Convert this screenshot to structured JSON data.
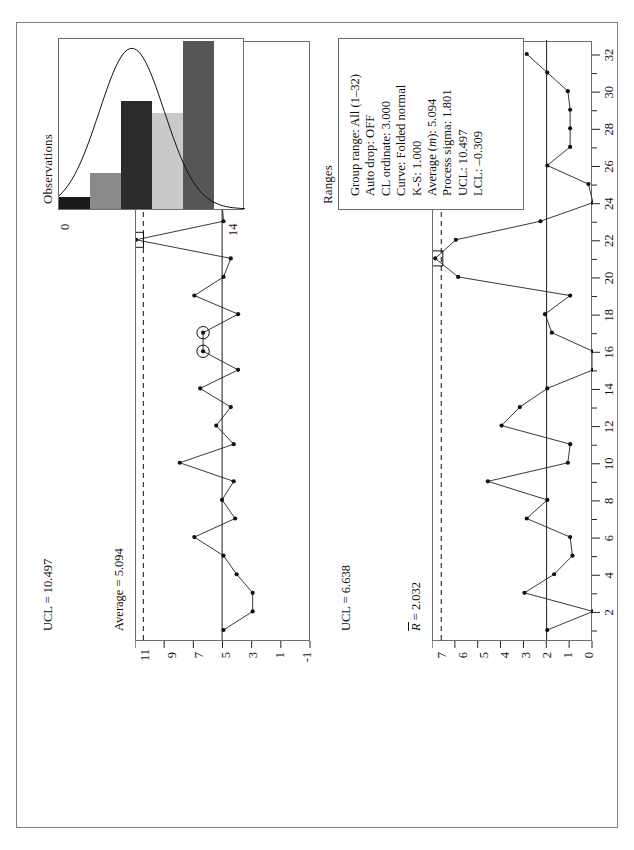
{
  "page": {
    "orientation": "landscape-rotated-90ccw",
    "border_color": "#808080"
  },
  "observations_panel": {
    "title": "Observations",
    "ucl_label": "UCL = 10.497",
    "center_label": "Average = 5.094",
    "y_ticks": [
      "11",
      "9",
      "7",
      "5",
      "3",
      "1",
      "-1"
    ]
  },
  "ranges_panel": {
    "title": "Ranges",
    "ucl_label": "UCL = 6.638",
    "center_label_prefix": "R",
    "center_label_suffix": " = 2.032",
    "lcl_label": "LCL = 0.000",
    "y_ticks": [
      "7",
      "6",
      "5",
      "4",
      "3",
      "2",
      "1",
      "0"
    ],
    "x_ticks": [
      "2",
      "4",
      "6",
      "8",
      "10",
      "12",
      "14",
      "16",
      "18",
      "20",
      "22",
      "24",
      "26",
      "28",
      "30",
      "32"
    ]
  },
  "stats": {
    "lines": [
      "Group range: All (1–32)",
      "Auto drop: OFF",
      "CL ordinate: 3.000",
      "Curve: Folded normal",
      "K-S: 1.000",
      "Process sigma: 1.801",
      "UCL: 10.497",
      "LCL: –0.309"
    ],
    "average_prefix": "Average (",
    "average_italic": "m",
    "average_suffix": "): 5.094"
  },
  "histogram": {
    "axis_min_label": "0",
    "axis_max_label": "14",
    "bin_counts": [
      1,
      3,
      9,
      8,
      14,
      0
    ],
    "bin_colors": [
      "#1a1a1a",
      "#8a8a8a",
      "#2b2b2b",
      "#c9c9c9",
      "#565656",
      "#ffffff"
    ],
    "max_count": 14,
    "curve_color": "#111111"
  },
  "chart_data": [
    {
      "type": "line",
      "title": "Observations",
      "xlabel": "",
      "ylabel": "Observations",
      "ylim": [
        -1,
        11
      ],
      "y_ticks": [
        11,
        9,
        7,
        5,
        3,
        1,
        -1
      ],
      "x": [
        1,
        2,
        3,
        4,
        5,
        6,
        7,
        8,
        9,
        10,
        11,
        12,
        13,
        14,
        15,
        16,
        17,
        18,
        19,
        20,
        21,
        22,
        23,
        24,
        25,
        26,
        27,
        28,
        29,
        30,
        31,
        32
      ],
      "values": [
        5.0,
        3.0,
        3.0,
        4.1,
        5.0,
        7.0,
        4.2,
        5.1,
        4.3,
        8.0,
        4.3,
        5.5,
        4.5,
        6.6,
        4.0,
        6.4,
        6.4,
        4.0,
        7.0,
        5.0,
        4.5,
        11.0,
        5.0,
        5.1,
        5.1,
        5.0,
        4.0,
        6.1,
        5.2,
        5.0,
        8.0,
        10.2
      ],
      "center_line": 5.094,
      "ucl": 10.497,
      "ucl_style": "dashed",
      "lcl": -0.309,
      "flagged_points": [
        16,
        17,
        29
      ],
      "flag_marker": "circle",
      "boxed_points": [
        22
      ],
      "box_marker": "square",
      "grid": false
    },
    {
      "type": "line",
      "title": "Ranges",
      "xlabel": "",
      "ylabel": "Ranges",
      "ylim": [
        0,
        7
      ],
      "y_ticks": [
        7,
        6,
        5,
        4,
        3,
        2,
        1,
        0
      ],
      "x": [
        1,
        2,
        3,
        4,
        5,
        6,
        7,
        8,
        9,
        10,
        11,
        12,
        13,
        14,
        15,
        16,
        17,
        18,
        19,
        20,
        21,
        22,
        23,
        24,
        25,
        26,
        27,
        28,
        29,
        30,
        31,
        32
      ],
      "values": [
        2.0,
        0.0,
        3.0,
        1.7,
        0.9,
        1.0,
        2.9,
        2.0,
        4.6,
        1.1,
        1.0,
        4.0,
        3.2,
        2.0,
        0.0,
        0.0,
        1.8,
        2.1,
        1.0,
        5.9,
        6.9,
        6.0,
        2.3,
        0.0,
        0.2,
        2.0,
        1.0,
        1.0,
        1.0,
        1.1,
        2.0,
        2.9
      ],
      "center_line": 2.032,
      "ucl": 6.638,
      "ucl_style": "dashed",
      "lcl": 0.0,
      "boxed_points": [
        21
      ],
      "box_marker": "square",
      "x_ticks": [
        2,
        4,
        6,
        8,
        10,
        12,
        14,
        16,
        18,
        20,
        22,
        24,
        26,
        28,
        30,
        32
      ],
      "grid": false
    },
    {
      "type": "bar",
      "title": "Histogram of observations",
      "categories": [
        "bin1",
        "bin2",
        "bin3",
        "bin4",
        "bin5",
        "bin6"
      ],
      "values": [
        1,
        3,
        9,
        8,
        14,
        0
      ],
      "xlabel": "",
      "ylabel": "",
      "ylim": [
        0,
        14
      ],
      "axis_labels": [
        "0",
        "14"
      ],
      "overlay_curve": "Folded normal"
    }
  ]
}
